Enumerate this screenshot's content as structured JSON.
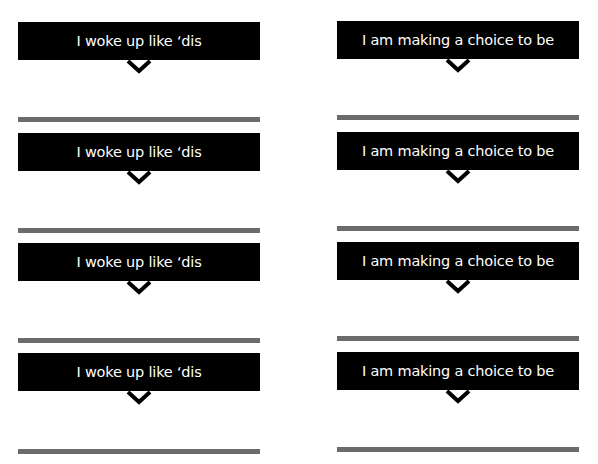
{
  "columns": [
    {
      "label": "I woke up like ‘dis",
      "count": 4
    },
    {
      "label": "I am making a choice to be",
      "count": 4
    }
  ],
  "cards": {
    "left": [
      "I woke up like ‘dis",
      "I woke up like ‘dis",
      "I woke up like ‘dis",
      "I woke up like ‘dis"
    ],
    "right": [
      "I am making a choice to be",
      "I am making a choice to be",
      "I am making a choice to be",
      "I am making a choice to be"
    ]
  },
  "icons": {
    "expand": "chevron-down-icon"
  },
  "colors": {
    "box": "#000000",
    "text": "#ffffff",
    "divider": "#6b6b6b"
  }
}
